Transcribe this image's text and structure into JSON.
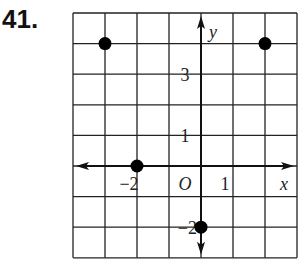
{
  "problem": {
    "number": "41."
  },
  "chart_data": {
    "type": "scatter",
    "title": "",
    "xlabel": "x",
    "ylabel": "y",
    "origin_label": "O",
    "xlim": [
      -4,
      3
    ],
    "ylim": [
      -3,
      5
    ],
    "grid": true,
    "grid_step": 1,
    "tick_labels": {
      "x": [
        {
          "value": -2,
          "label": "−2"
        },
        {
          "value": 1,
          "label": "1"
        }
      ],
      "y": [
        {
          "value": 3,
          "label": "3"
        },
        {
          "value": 1,
          "label": "1"
        },
        {
          "value": -2,
          "label": "−2"
        }
      ]
    },
    "points": [
      {
        "x": -3,
        "y": 4
      },
      {
        "x": 2,
        "y": 4
      },
      {
        "x": -2,
        "y": 0
      },
      {
        "x": 0,
        "y": -2
      }
    ],
    "colors": {
      "grid": "#222222",
      "axis": "#111111",
      "point": "#000000"
    }
  }
}
